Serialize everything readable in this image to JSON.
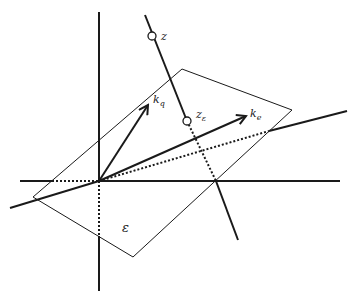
{
  "diagram": {
    "colors": {
      "stroke": "#1a1a1a",
      "background": "#ffffff"
    },
    "labels": {
      "z": "z",
      "z_eps_main": "z",
      "z_eps_sub": "ε",
      "k_q_main": "k",
      "k_q_sub": "q",
      "k_e_main": "k",
      "k_e_sub": "e",
      "plane": "ε"
    },
    "elements": [
      "plane ε (parallelogram)",
      "vertical axis",
      "horizontal axis",
      "oblique line through origin",
      "line z through points z and z_ε",
      "vector k_q",
      "vector k_e"
    ]
  }
}
